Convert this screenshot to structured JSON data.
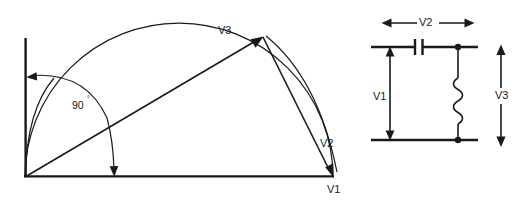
{
  "figure": {
    "background_color": "#ffffff",
    "line_color": "#1a1a1a",
    "width": 523,
    "height": 201
  },
  "phasor_diagram": {
    "name": "phasor-semicircle-diagram",
    "labels": {
      "v1": "V1",
      "v2": "V2",
      "v3": "V3",
      "angle": "90",
      "angle_degree_symbol": "°",
      "angle_full": "90°"
    },
    "geometry": {
      "origin": [
        25,
        177
      ],
      "v1_endpoint": [
        333,
        177
      ],
      "v3_endpoint": [
        262,
        37
      ],
      "vertical_axis_top": [
        25,
        38
      ],
      "semicircle_center": [
        179,
        177
      ],
      "semicircle_radius": 154,
      "angle_value_degrees": 90
    },
    "vectors": [
      {
        "name": "V3",
        "from": [
          25,
          177
        ],
        "to": [
          262,
          37
        ],
        "arrowhead": "at-tip"
      },
      {
        "name": "V2",
        "from": [
          262,
          37
        ],
        "to": [
          333,
          177
        ],
        "arrowhead": "at-tip"
      }
    ],
    "angle_arc": {
      "from_axis": "vertical",
      "to_axis": "horizontal",
      "double_headed": true,
      "measure": "90°"
    }
  },
  "circuit_diagram": {
    "name": "rc-circuit-diagram",
    "labels": {
      "v1": "V1",
      "v2": "V2",
      "v3": "V3"
    },
    "components": [
      {
        "name": "capacitor",
        "symbol": "capacitor",
        "position": "top-rail-center"
      },
      {
        "name": "inductor",
        "symbol": "coil-zigzag",
        "position": "right-branch-vertical"
      }
    ],
    "measurements": [
      {
        "label": "V2",
        "orientation": "horizontal",
        "double_headed": true,
        "location": "above-top-rail"
      },
      {
        "label": "V1",
        "orientation": "vertical",
        "double_headed": true,
        "location": "left-branch"
      },
      {
        "label": "V3",
        "orientation": "vertical",
        "double_headed": true,
        "location": "right-outside"
      }
    ],
    "junction_dots": [
      [
        458,
        47
      ],
      [
        458,
        140
      ]
    ]
  }
}
